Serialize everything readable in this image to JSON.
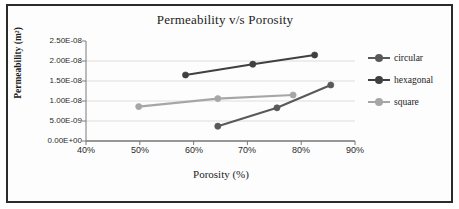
{
  "chart_data": {
    "type": "line",
    "title": "Permeability v/s Porosity",
    "xlabel": "Porosity (%)",
    "ylabel": "Permeability (m²)",
    "xlim": [
      40,
      90
    ],
    "ylim": [
      0,
      2.5e-08
    ],
    "xticks": [
      "40%",
      "50%",
      "60%",
      "70%",
      "80%",
      "90%"
    ],
    "yticks": [
      "0.00E+00",
      "5.00E-09",
      "1.00E-08",
      "1.50E-08",
      "2.00E-08",
      "2.50E-08"
    ],
    "grid": true,
    "legend_position": "right",
    "series": [
      {
        "name": "circular",
        "color": "#595959",
        "points": [
          {
            "x": 64.5,
            "y": 3.7e-09
          },
          {
            "x": 75.5,
            "y": 8.3e-09
          },
          {
            "x": 85.5,
            "y": 1.4e-08
          }
        ]
      },
      {
        "name": "hexagonal",
        "color": "#404040",
        "points": [
          {
            "x": 58.5,
            "y": 1.65e-08
          },
          {
            "x": 71.0,
            "y": 1.92e-08
          },
          {
            "x": 82.5,
            "y": 2.15e-08
          }
        ]
      },
      {
        "name": "square",
        "color": "#a6a6a6",
        "points": [
          {
            "x": 49.8,
            "y": 8.6e-09
          },
          {
            "x": 64.5,
            "y": 1.06e-08
          },
          {
            "x": 78.5,
            "y": 1.15e-08
          }
        ]
      }
    ]
  },
  "chart": {
    "title": "Permeability v/s Porosity",
    "y_axis_title": "Permeability (m²)",
    "x_axis_title": "Porosity (%)",
    "y_tick_labels": [
      "2.50E-08",
      "2.00E-08",
      "1.50E-08",
      "1.00E-08",
      "5.00E-09",
      "0.00E+00"
    ],
    "x_tick_labels": [
      "40%",
      "50%",
      "60%",
      "70%",
      "80%",
      "90%"
    ],
    "legend": [
      {
        "label": "circular",
        "color": "#595959"
      },
      {
        "label": "hexagonal",
        "color": "#404040"
      },
      {
        "label": "square",
        "color": "#a6a6a6"
      }
    ]
  }
}
